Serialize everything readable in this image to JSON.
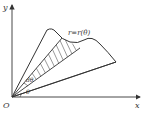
{
  "diagram": {
    "type": "polar-area-element",
    "axes": {
      "x_label": "x",
      "y_label": "y",
      "origin_label": "O"
    },
    "curve_label": "r=r(θ)",
    "angle_labels": {
      "theta": "θ",
      "dtheta": "dθ"
    },
    "caption": ""
  }
}
